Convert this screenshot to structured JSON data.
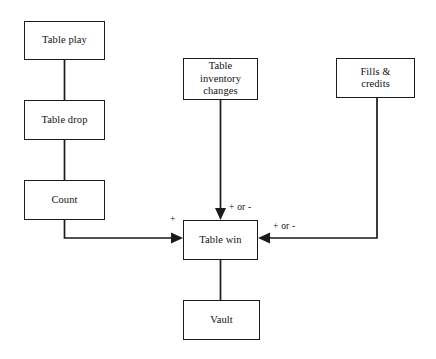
{
  "diagram": {
    "background_color": "#ffffff",
    "line_color": "#1a1a1a",
    "text_color": "#111111",
    "nodes": [
      {
        "id": "table-play",
        "label": "Table play",
        "x": 24,
        "y": 21,
        "w": 81,
        "h": 39
      },
      {
        "id": "table-drop",
        "label": "Table drop",
        "x": 24,
        "y": 100,
        "w": 81,
        "h": 40
      },
      {
        "id": "count",
        "label": "Count",
        "x": 24,
        "y": 180,
        "w": 81,
        "h": 40
      },
      {
        "id": "table-inventory",
        "label": "Table\ninventory\nchanges",
        "x": 183,
        "y": 58,
        "w": 75,
        "h": 42
      },
      {
        "id": "fills-credits",
        "label": "Fills &\ncredits",
        "x": 336,
        "y": 58,
        "w": 79,
        "h": 40
      },
      {
        "id": "table-win",
        "label": "Table win",
        "x": 183,
        "y": 220,
        "w": 75,
        "h": 40
      },
      {
        "id": "vault",
        "label": "Vault",
        "x": 183,
        "y": 300,
        "w": 77,
        "h": 40
      }
    ],
    "edge_labels": [
      {
        "id": "plus-left",
        "text": "+",
        "x": 170,
        "y": 215
      },
      {
        "id": "plus-or-minus-top",
        "text": "+ or -",
        "x": 229,
        "y": 203
      },
      {
        "id": "plus-or-minus-right",
        "text": "+ or -",
        "x": 273,
        "y": 222
      }
    ],
    "connectors": [
      {
        "id": "table-play-to-table-drop",
        "from": "table-play",
        "to": "table-drop",
        "arrow": false
      },
      {
        "id": "table-drop-to-count",
        "from": "table-drop",
        "to": "count",
        "arrow": false
      },
      {
        "id": "count-to-table-win",
        "from": "count",
        "to": "table-win",
        "arrow": true
      },
      {
        "id": "table-inventory-to-table-win",
        "from": "table-inventory",
        "to": "table-win",
        "arrow": true
      },
      {
        "id": "fills-credits-to-table-win",
        "from": "fills-credits",
        "to": "table-win",
        "arrow": true
      },
      {
        "id": "table-win-to-vault",
        "from": "table-win",
        "to": "vault",
        "arrow": false
      }
    ]
  }
}
